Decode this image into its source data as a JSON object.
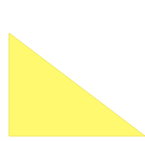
{
  "canvas": {
    "width": 145,
    "height": 141,
    "background": "#ffffff"
  },
  "shape": {
    "type": "right-triangle",
    "points": "9,33 9,136 145,136",
    "fill": "#fff970",
    "stroke": "#f2e860"
  }
}
